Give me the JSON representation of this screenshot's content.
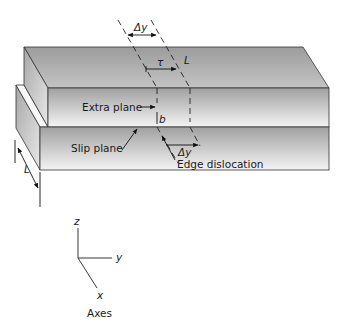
{
  "figure": {
    "labels": {
      "delta_y_top": "Δy",
      "tau": "τ",
      "L_top": "L",
      "extra_plane": "Extra plane",
      "b": "b",
      "slip_plane": "Slip plane",
      "delta_y_bottom": "Δy",
      "edge_dislocation": "Edge dislocation",
      "L_side": "L"
    },
    "axes": {
      "z": "z",
      "y": "y",
      "x": "x",
      "caption": "Axes"
    }
  },
  "colors": {
    "face_dark": "#9a9a9a",
    "face_light": "#f2f2f2",
    "edge": "#333333",
    "text": "#1a1a1a"
  }
}
